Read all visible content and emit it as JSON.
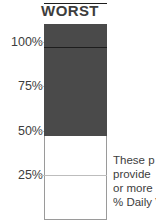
{
  "chart_data": {
    "type": "bar",
    "title": "WORST",
    "xlabel": "",
    "ylabel": "",
    "categories": [
      "WORST"
    ],
    "values": [
      63
    ],
    "ylim": [
      0,
      110
    ],
    "grid": true,
    "legend": null,
    "tick_labels": [
      "100%",
      "75%",
      "50%",
      "25%"
    ],
    "tick_values": [
      100,
      75,
      50,
      25
    ],
    "series": [
      {
        "name": "WORST",
        "values": [
          63
        ],
        "color": "#4a4a4a"
      }
    ],
    "segment_breaks": [
      75,
      50
    ],
    "annotation_lines": [
      "These p",
      "provide",
      "or more",
      "% Daily V"
    ]
  },
  "chart": {
    "title": "WORST",
    "ticks": [
      {
        "label": "100%",
        "value": 100
      },
      {
        "label": "75%",
        "value": 75
      },
      {
        "label": "50%",
        "value": 50
      },
      {
        "label": "25%",
        "value": 25
      }
    ],
    "bar": {
      "fill_percent": 63,
      "fill_color": "#4a4a4a",
      "track_color": "#ffffff",
      "outline_color": "#9a9a9a",
      "divider_color": "#1d1d1d"
    },
    "annotation": {
      "line1": "These p",
      "line2": "provide",
      "line3": "or more",
      "line4": "% Daily V"
    },
    "colors": {
      "text": "#3d3d3d",
      "grid": "#bdbdbd",
      "background": "#ffffff"
    }
  }
}
